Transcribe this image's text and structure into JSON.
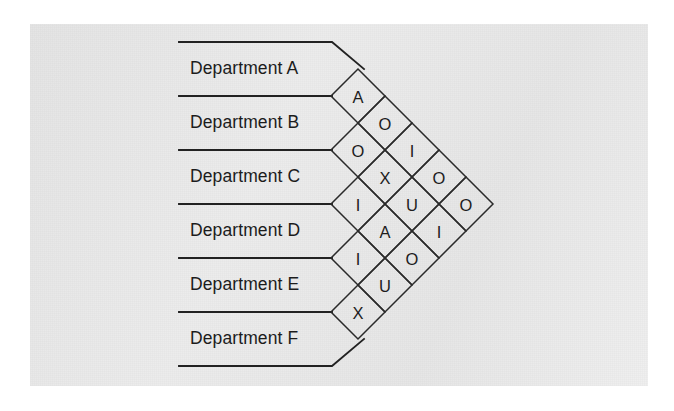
{
  "figure": {
    "kind": "rel-chart",
    "title": "",
    "panel_background": "#e9e9e9",
    "page_background": "#ffffff",
    "line_color": "#222222",
    "text_color": "#1c1c1c"
  },
  "departments": [
    {
      "id": "A",
      "label": "Department A"
    },
    {
      "id": "B",
      "label": "Department B"
    },
    {
      "id": "C",
      "label": "Department C"
    },
    {
      "id": "D",
      "label": "Department D"
    },
    {
      "id": "E",
      "label": "Department E"
    },
    {
      "id": "F",
      "label": "Department F"
    }
  ],
  "rating_codes": [
    "A",
    "E",
    "I",
    "O",
    "U",
    "X"
  ],
  "chart_data": {
    "type": "table",
    "xlabel": "",
    "ylabel": "",
    "categories": [
      "Department A",
      "Department B",
      "Department C",
      "Department D",
      "Department E",
      "Department F"
    ],
    "legend": [],
    "grid": false,
    "cells": [
      {
        "pair": "A-B",
        "row": 0,
        "col": 0,
        "value": "A"
      },
      {
        "pair": "A-C",
        "row": 0,
        "col": 1,
        "value": "O"
      },
      {
        "pair": "A-D",
        "row": 0,
        "col": 2,
        "value": "I"
      },
      {
        "pair": "A-E",
        "row": 0,
        "col": 3,
        "value": "O"
      },
      {
        "pair": "A-F",
        "row": 0,
        "col": 4,
        "value": "O"
      },
      {
        "pair": "B-C",
        "row": 1,
        "col": 0,
        "value": "O"
      },
      {
        "pair": "B-D",
        "row": 1,
        "col": 1,
        "value": "X"
      },
      {
        "pair": "B-E",
        "row": 1,
        "col": 2,
        "value": "U"
      },
      {
        "pair": "B-F",
        "row": 1,
        "col": 3,
        "value": "I"
      },
      {
        "pair": "C-D",
        "row": 2,
        "col": 0,
        "value": "I"
      },
      {
        "pair": "C-E",
        "row": 2,
        "col": 1,
        "value": "A"
      },
      {
        "pair": "C-F",
        "row": 2,
        "col": 2,
        "value": "O"
      },
      {
        "pair": "D-E",
        "row": 3,
        "col": 0,
        "value": "I"
      },
      {
        "pair": "D-F",
        "row": 3,
        "col": 1,
        "value": "U"
      },
      {
        "pair": "E-F",
        "row": 4,
        "col": 0,
        "value": "X"
      }
    ],
    "diagonals": [
      {
        "index": 0,
        "values": [
          "A",
          "O",
          "I",
          "I",
          "X"
        ]
      },
      {
        "index": 1,
        "values": [
          "O",
          "X",
          "A",
          "U"
        ]
      },
      {
        "index": 2,
        "values": [
          "I",
          "U",
          "O"
        ]
      },
      {
        "index": 3,
        "values": [
          "O",
          "I"
        ]
      },
      {
        "index": 4,
        "values": [
          "O"
        ]
      }
    ]
  },
  "geometry": {
    "band_line_x_start": 179,
    "band_line_x_end": 332,
    "apex_x": 337,
    "first_line_y": 42,
    "line_spacing": 54,
    "label_x": 190,
    "diamond_half": 27,
    "diamond_origin_x": 358,
    "diamond_origin_y": 96
  }
}
